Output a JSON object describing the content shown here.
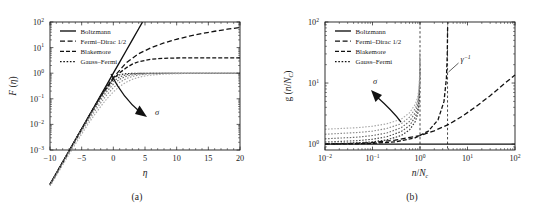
{
  "figure": {
    "panels": [
      {
        "id": "a",
        "caption": "(a)",
        "legend": {
          "items": [
            {
              "label": "Boltzmann",
              "style": "solid"
            },
            {
              "label": "Fermi–Dirac 1/2",
              "style": "dashed"
            },
            {
              "label": "Blakemore",
              "style": "dashdot"
            },
            {
              "label": "Gauss–Fermi",
              "style": "dotted"
            }
          ]
        },
        "annotations": [
          {
            "name": "sigma-arrow",
            "label": "σ",
            "direction": "down-right"
          }
        ]
      },
      {
        "id": "b",
        "caption": "(b)",
        "legend": {
          "items": [
            {
              "label": "Boltzmann",
              "style": "solid"
            },
            {
              "label": "Fermi–Dirac 1/2",
              "style": "dashed"
            },
            {
              "label": "Blakemore",
              "style": "dashdot"
            },
            {
              "label": "Gauss–Fermi",
              "style": "dotted"
            }
          ]
        },
        "annotations": [
          {
            "name": "sigma-arrow",
            "label": "σ",
            "direction": "up-left"
          },
          {
            "name": "gamma-inverse-label",
            "base": "γ",
            "exponent": "−1"
          }
        ]
      }
    ]
  },
  "chart_data": [
    {
      "type": "line",
      "panel": "a",
      "title": "",
      "xlabel": "η",
      "ylabel": "F (η)",
      "xscale": "linear",
      "yscale": "log",
      "xlim": [
        -10,
        20
      ],
      "ylim": [
        0.001,
        100
      ],
      "xticks": [
        -10,
        -5,
        0,
        5,
        10,
        15,
        20
      ],
      "xticklabels": [
        "−10",
        "−5",
        "0",
        "5",
        "10",
        "15",
        "20"
      ],
      "yticks": [
        0.001,
        0.01,
        0.1,
        1,
        10,
        100
      ],
      "yticklabels": [
        "10⁻³",
        "10⁻²",
        "10⁻¹",
        "10⁰",
        "10¹",
        "10²"
      ],
      "grid": false,
      "legend_position": "upper-left",
      "series": [
        {
          "name": "Boltzmann",
          "style": "solid",
          "color": "#111111",
          "x": [
            -10,
            -8,
            -7,
            -6,
            -5,
            -4,
            -3,
            -2,
            -1,
            0,
            1,
            2,
            3,
            4,
            4.6
          ],
          "y": [
            4.54e-05,
            0.000335,
            0.000912,
            0.00248,
            0.00674,
            0.0183,
            0.0498,
            0.135,
            0.368,
            1.0,
            2.718,
            7.39,
            20.1,
            54.6,
            99.5
          ]
        },
        {
          "name": "Fermi–Dirac 1/2",
          "style": "dashed",
          "color": "#111111",
          "x": [
            -10,
            -8,
            -6,
            -4,
            -2,
            0,
            2,
            4,
            6,
            8,
            10,
            12,
            14,
            16,
            18,
            20
          ],
          "y": [
            4.5e-05,
            0.00033,
            0.00245,
            0.0179,
            0.127,
            0.678,
            2.5,
            5.77,
            10.0,
            15.2,
            21.2,
            28.0,
            35.4,
            43.5,
            52.2,
            61.5
          ]
        },
        {
          "name": "Blakemore",
          "style": "dashdot",
          "color": "#111111",
          "x": [
            -10,
            -8,
            -6,
            -4,
            -2,
            0,
            1,
            2,
            3,
            4,
            6,
            8,
            10,
            14,
            20
          ],
          "y": [
            4.5e-05,
            0.00033,
            0.00246,
            0.0178,
            0.123,
            0.6,
            1.03,
            1.61,
            2.25,
            2.82,
            3.53,
            3.82,
            3.93,
            3.98,
            4.0
          ]
        },
        {
          "name": "Gauss–Fermi σ₁",
          "style": "dotted",
          "color": "#2e2e2e",
          "x": [
            -10,
            -8,
            -6,
            -4,
            -3,
            -2,
            -1,
            0,
            1,
            2,
            3,
            4,
            5,
            6,
            8,
            10,
            14,
            20
          ],
          "y": [
            4.5e-05,
            0.00033,
            0.00245,
            0.018,
            0.0485,
            0.128,
            0.32,
            0.64,
            0.87,
            0.96,
            0.988,
            0.996,
            0.999,
            1.0,
            1.0,
            1.0,
            1.0,
            1.0
          ]
        },
        {
          "name": "Gauss–Fermi σ₂",
          "style": "dotted",
          "color": "#4d4d4d",
          "x": [
            -10,
            -8,
            -6,
            -4,
            -3,
            -2,
            -1,
            0,
            1,
            2,
            3,
            4,
            5,
            6,
            8,
            10,
            14,
            20
          ],
          "y": [
            4.5e-05,
            0.00033,
            0.00244,
            0.0172,
            0.044,
            0.108,
            0.245,
            0.48,
            0.72,
            0.87,
            0.945,
            0.978,
            0.991,
            0.996,
            0.999,
            1.0,
            1.0,
            1.0
          ]
        },
        {
          "name": "Gauss–Fermi σ₃",
          "style": "dotted",
          "color": "#6b6b6b",
          "x": [
            -10,
            -8,
            -6,
            -4,
            -3,
            -2,
            -1,
            0,
            1,
            2,
            3,
            4,
            5,
            6,
            8,
            10,
            14,
            20
          ],
          "y": [
            4.4e-05,
            0.00032,
            0.00235,
            0.0158,
            0.0385,
            0.09,
            0.196,
            0.37,
            0.58,
            0.75,
            0.865,
            0.93,
            0.965,
            0.982,
            0.996,
            0.999,
            1.0,
            1.0
          ]
        },
        {
          "name": "Gauss–Fermi σ₄",
          "style": "dotted",
          "color": "#8a8a8a",
          "x": [
            -10,
            -8,
            -6,
            -4,
            -3,
            -2,
            -1,
            0,
            1,
            2,
            3,
            4,
            5,
            6,
            8,
            10,
            14,
            20
          ],
          "y": [
            4.2e-05,
            0.0003,
            0.0021,
            0.0132,
            0.031,
            0.069,
            0.146,
            0.27,
            0.44,
            0.61,
            0.75,
            0.85,
            0.915,
            0.952,
            0.985,
            0.995,
            0.999,
            1.0
          ]
        },
        {
          "name": "Gauss–Fermi σ₅",
          "style": "dotted",
          "color": "#a8a8a8",
          "x": [
            -10,
            -8,
            -6,
            -4,
            -3,
            -2,
            -1,
            0,
            1,
            2,
            3,
            4,
            5,
            6,
            8,
            10,
            12,
            14,
            17,
            20
          ],
          "y": [
            3.8e-05,
            0.00026,
            0.0017,
            0.0102,
            0.0232,
            0.05,
            0.102,
            0.186,
            0.305,
            0.44,
            0.575,
            0.69,
            0.78,
            0.845,
            0.925,
            0.962,
            0.98,
            0.99,
            0.997,
            1.0
          ]
        }
      ]
    },
    {
      "type": "line",
      "panel": "b",
      "title": "",
      "xlabel": "n/N_C",
      "ylabel": "g (n/N_C)",
      "xscale": "log",
      "yscale": "log",
      "xlim": [
        0.01,
        100
      ],
      "ylim": [
        0.8,
        100
      ],
      "xticks": [
        0.01,
        0.1,
        1,
        10,
        100
      ],
      "xticklabels": [
        "10⁻²",
        "10⁻¹",
        "10⁰",
        "10¹",
        "10²"
      ],
      "yticks": [
        1,
        10,
        100
      ],
      "yticklabels": [
        "10⁰",
        "10¹",
        "10²"
      ],
      "grid": false,
      "legend_position": "upper-left",
      "vlines": [
        {
          "x": 1,
          "style": "dashed",
          "label": ""
        },
        {
          "x": 3.8,
          "style": "dashed",
          "label": "γ⁻¹"
        }
      ],
      "series": [
        {
          "name": "Boltzmann",
          "style": "solid",
          "color": "#111111",
          "x": [
            0.01,
            100
          ],
          "y": [
            1.0,
            1.0
          ]
        },
        {
          "name": "Fermi–Dirac 1/2",
          "style": "dashed",
          "color": "#111111",
          "x": [
            0.01,
            0.03,
            0.1,
            0.3,
            1,
            2,
            4,
            8,
            15,
            30,
            60,
            100
          ],
          "y": [
            1.006,
            1.018,
            1.058,
            1.16,
            1.38,
            1.65,
            2.1,
            2.9,
            4.1,
            6.2,
            9.8,
            13.5
          ]
        },
        {
          "name": "Blakemore",
          "style": "dashdot",
          "color": "#111111",
          "x": [
            0.01,
            0.05,
            0.1,
            0.3,
            0.8,
            1.5,
            2.4,
            3.2,
            3.6,
            3.75,
            3.82
          ],
          "y": [
            1.003,
            1.013,
            1.027,
            1.085,
            1.27,
            1.63,
            2.5,
            5.0,
            12.0,
            30.0,
            90.0
          ]
        },
        {
          "name": "Gauss–Fermi σ₁",
          "style": "dotted",
          "color": "#2e2e2e",
          "x": [
            0.01,
            0.05,
            0.1,
            0.2,
            0.4,
            0.6,
            0.8,
            0.9,
            0.95,
            0.98,
            0.995
          ],
          "y": [
            1.02,
            1.05,
            1.09,
            1.17,
            1.38,
            1.7,
            2.35,
            3.2,
            4.4,
            7.0,
            18.0
          ]
        },
        {
          "name": "Gauss–Fermi σ₂",
          "style": "dotted",
          "color": "#4d4d4d",
          "x": [
            0.01,
            0.05,
            0.1,
            0.2,
            0.4,
            0.6,
            0.8,
            0.9,
            0.95,
            0.98,
            0.995
          ],
          "y": [
            1.08,
            1.14,
            1.2,
            1.32,
            1.6,
            2.0,
            2.8,
            3.8,
            5.2,
            8.5,
            22.0
          ]
        },
        {
          "name": "Gauss–Fermi σ₃",
          "style": "dotted",
          "color": "#6b6b6b",
          "x": [
            0.01,
            0.05,
            0.1,
            0.2,
            0.4,
            0.6,
            0.8,
            0.9,
            0.95,
            0.98,
            0.995
          ],
          "y": [
            1.22,
            1.3,
            1.38,
            1.52,
            1.85,
            2.35,
            3.3,
            4.5,
            6.2,
            10.0,
            26.0
          ]
        },
        {
          "name": "Gauss–Fermi σ₄",
          "style": "dotted",
          "color": "#8a8a8a",
          "x": [
            0.01,
            0.05,
            0.1,
            0.2,
            0.4,
            0.6,
            0.8,
            0.9,
            0.95,
            0.98,
            0.995
          ],
          "y": [
            1.45,
            1.55,
            1.63,
            1.8,
            2.15,
            2.75,
            3.85,
            5.2,
            7.2,
            11.5,
            30.0
          ]
        },
        {
          "name": "Gauss–Fermi σ₅",
          "style": "dotted",
          "color": "#a8a8a8",
          "x": [
            0.01,
            0.05,
            0.1,
            0.2,
            0.4,
            0.6,
            0.8,
            0.9,
            0.95,
            0.98,
            0.995
          ],
          "y": [
            1.75,
            1.86,
            1.96,
            2.15,
            2.55,
            3.25,
            4.5,
            6.0,
            8.2,
            13.0,
            34.0
          ]
        }
      ]
    }
  ]
}
